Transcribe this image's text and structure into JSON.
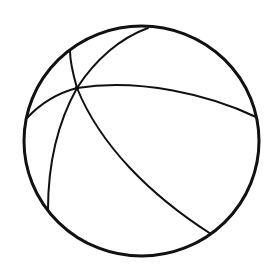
{
  "figure": {
    "subject": "beach ball line drawing",
    "background": "#ffffff",
    "stroke_color": "#111111",
    "outline": {
      "cx": 141.5,
      "cy": 141,
      "rx": 117.5,
      "ry": 115,
      "stroke_width": 3
    },
    "hub": {
      "x": 77,
      "y": 88
    },
    "seams": [
      {
        "name": "seam-top",
        "d": "M77 88 C 95 60, 120 38, 148 28"
      },
      {
        "name": "seam-top-left",
        "d": "M77 88 C 73 74, 70 62, 70 51"
      },
      {
        "name": "seam-left",
        "d": "M77 88 C 58 93, 40 104, 27 118"
      },
      {
        "name": "seam-right",
        "d": "M77 88 C 140 78, 210 95, 256 117"
      },
      {
        "name": "seam-bottom-left",
        "d": "M77 88 C 58 122, 48 165, 48 210"
      },
      {
        "name": "seam-bottom-right",
        "d": "M77 88 C 100 145, 150 195, 211 234"
      }
    ],
    "seam_stroke_width": 2
  }
}
